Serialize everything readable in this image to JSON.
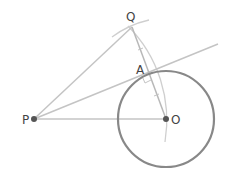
{
  "diagram": {
    "labels": {
      "P": "P",
      "O": "O",
      "Q": "Q",
      "A": "A"
    },
    "colors": {
      "circle": "#888888",
      "lines": "#c4c4c4",
      "points": "#555555",
      "text": "#444444"
    },
    "points": {
      "P": [
        34,
        119
      ],
      "O": [
        166,
        119
      ],
      "Q": [
        132,
        27
      ],
      "A": [
        148,
        72
      ]
    },
    "circle": {
      "center": "O",
      "radius": 48
    }
  }
}
